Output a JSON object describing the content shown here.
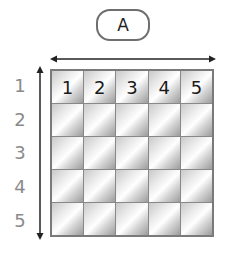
{
  "column_header_label": "A",
  "column_numbers": [
    "1",
    "2",
    "3",
    "4",
    "5"
  ],
  "row_labels": [
    "1",
    "2",
    "3",
    "4",
    "5"
  ],
  "grid": {
    "rows": 5,
    "columns": 5
  },
  "arrows": {
    "horizontal": "double-headed arrow spanning columns",
    "vertical": "double-headed arrow spanning rows"
  },
  "colors": {
    "border": "#7a7a7a",
    "row_label": "#8a8a8a",
    "text": "#1a1a1a"
  }
}
